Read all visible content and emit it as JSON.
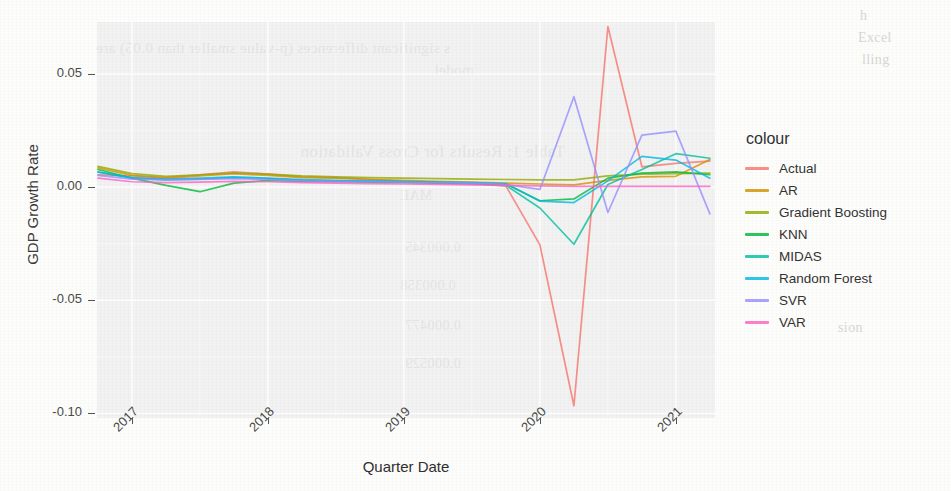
{
  "chart_data": {
    "type": "line",
    "title": "",
    "xlabel": "Quarter Date",
    "ylabel": "GDP Growth Rate",
    "xlim": [
      "2016-10-01",
      "2021-04-01"
    ],
    "ylim": [
      -0.102,
      0.073
    ],
    "grid": true,
    "legend_title": "colour",
    "legend_position": "right",
    "x_tick_labels": [
      "2017",
      "2018",
      "2019",
      "2020",
      "2021"
    ],
    "y_tick_labels": [
      "0.05",
      "0.00",
      "-0.05",
      "-0.10"
    ],
    "y_tick_values": [
      0.05,
      0.0,
      -0.05,
      -0.1
    ],
    "x": [
      "2016-10-01",
      "2017-01-01",
      "2017-04-01",
      "2017-07-01",
      "2017-10-01",
      "2018-01-01",
      "2018-04-01",
      "2018-07-01",
      "2018-10-01",
      "2019-01-01",
      "2019-04-01",
      "2019-07-01",
      "2019-10-01",
      "2020-01-01",
      "2020-04-01",
      "2020-07-01",
      "2020-10-01",
      "2021-01-01",
      "2021-04-01"
    ],
    "series": [
      {
        "name": "Actual",
        "color": "#F8766D",
        "values": [
          0.0055,
          0.005,
          0.0042,
          0.0055,
          0.0068,
          0.0058,
          0.0046,
          0.0042,
          0.0034,
          0.0026,
          0.0022,
          0.0018,
          0.0005,
          -0.0255,
          -0.0966,
          0.071,
          0.009,
          0.0105,
          0.0115
        ]
      },
      {
        "name": "AR",
        "color": "#D39200",
        "values": [
          0.0085,
          0.0052,
          0.004,
          0.005,
          0.006,
          0.0052,
          0.0042,
          0.004,
          0.0035,
          0.003,
          0.0026,
          0.0022,
          0.0018,
          0.0014,
          0.001,
          0.003,
          0.0046,
          0.0048,
          0.0122
        ]
      },
      {
        "name": "Gradient Boosting",
        "color": "#93AA00",
        "values": [
          0.0092,
          0.006,
          0.0048,
          0.0055,
          0.0062,
          0.0058,
          0.005,
          0.0046,
          0.0042,
          0.004,
          0.0038,
          0.0036,
          0.0034,
          0.0032,
          0.0032,
          0.005,
          0.0058,
          0.006,
          0.0062
        ]
      },
      {
        "name": "KNN",
        "color": "#00BA38",
        "values": [
          0.0078,
          0.004,
          0.0008,
          -0.002,
          0.0018,
          0.003,
          0.0026,
          0.0024,
          0.0022,
          0.002,
          0.0018,
          0.0016,
          0.0014,
          -0.006,
          -0.0052,
          0.004,
          0.0062,
          0.0068,
          0.0055
        ]
      },
      {
        "name": "MIDAS",
        "color": "#00C19F",
        "values": [
          0.0068,
          0.004,
          0.0032,
          0.0036,
          0.0042,
          0.0038,
          0.003,
          0.0028,
          0.0026,
          0.0024,
          0.002,
          0.0016,
          0.0008,
          -0.0092,
          -0.0252,
          0.0012,
          0.0078,
          0.0148,
          0.0128
        ]
      },
      {
        "name": "Random Forest",
        "color": "#00B9E3",
        "values": [
          0.0066,
          0.0042,
          0.0036,
          0.004,
          0.0046,
          0.004,
          0.0034,
          0.003,
          0.0028,
          0.0026,
          0.0022,
          0.002,
          0.0016,
          -0.0062,
          -0.0068,
          0.0028,
          0.0136,
          0.012,
          0.004
        ]
      },
      {
        "name": "SVR",
        "color": "#9590FF",
        "values": [
          0.0052,
          0.0036,
          0.0032,
          0.0034,
          0.0038,
          0.0034,
          0.0028,
          0.0026,
          0.0024,
          0.0022,
          0.002,
          0.0018,
          0.0012,
          -0.001,
          0.04,
          -0.0112,
          0.023,
          0.0248,
          -0.0118
        ]
      },
      {
        "name": "VAR",
        "color": "#FF61C3",
        "values": [
          0.004,
          0.0024,
          0.002,
          0.0022,
          0.0026,
          0.0024,
          0.002,
          0.0018,
          0.0016,
          0.0014,
          0.0012,
          0.001,
          0.0008,
          0.0006,
          0.0004,
          0.0004,
          0.0004,
          0.0004,
          0.0004
        ]
      }
    ]
  },
  "axes": {
    "y_title": "GDP Growth Rate",
    "x_title": "Quarter Date"
  },
  "legend": {
    "title": "colour",
    "items": [
      {
        "label": "Actual",
        "color": "#F8766D"
      },
      {
        "label": "AR",
        "color": "#D39200"
      },
      {
        "label": "Gradient Boosting",
        "color": "#93AA00"
      },
      {
        "label": "KNN",
        "color": "#00BA38"
      },
      {
        "label": "MIDAS",
        "color": "#00C19F"
      },
      {
        "label": "Random Forest",
        "color": "#00B9E3"
      },
      {
        "label": "SVR",
        "color": "#9590FF"
      },
      {
        "label": "VAR",
        "color": "#FF61C3"
      }
    ]
  },
  "bleed_through": {
    "line1": "s significant differences (p-value smaller than 0.05) are",
    "line2": "model.",
    "title": "Table 1: Results for Cross Validation",
    "cell1": "MAE",
    "cell2": "0.000345",
    "cell3": "0.000358",
    "cell4": "0.000477",
    "cell5": "0.000529",
    "right1": "h",
    "right2": "Excel",
    "right3": "lling",
    "side": "sion"
  }
}
